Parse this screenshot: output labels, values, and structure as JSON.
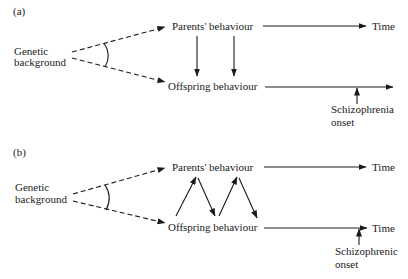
{
  "panels": [
    {
      "label": "(a)",
      "genetic_line1": "Genetic",
      "genetic_line2": "background",
      "parents": "Parents' behaviour",
      "offspring": "Offspring behaviour",
      "time_top": "Time",
      "time_bottom": "",
      "onset_line1": "Schizophrenia",
      "onset_line2": "onset",
      "arrows_between": "parents-to-offspring (one-way, two arrows)"
    },
    {
      "label": "(b)",
      "genetic_line1": "Genetic",
      "genetic_line2": "background",
      "parents": "Parents' behaviour",
      "offspring": "Offspring behaviour",
      "time_top": "Time",
      "time_bottom": "Time",
      "onset_line1": "Schizophrenic",
      "onset_line2": "onset",
      "arrows_between": "bidirectional zig-zag"
    }
  ],
  "colors": {
    "ink": "#1a1a1a",
    "background": "#ffffff"
  }
}
